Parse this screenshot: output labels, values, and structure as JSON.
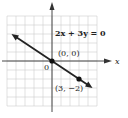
{
  "chart_data": {
    "type": "line",
    "title": "",
    "equation": "2x + 3y = 0",
    "xlabel": "x",
    "ylabel": "",
    "origin_label": "0",
    "xlim": [
      -5,
      5
    ],
    "ylim": [
      -5,
      5
    ],
    "grid": true,
    "series": [
      {
        "name": "2x + 3y = 0",
        "slope": -0.6667,
        "intercept": 0,
        "x": [
          -4.5,
          4.5
        ],
        "y": [
          3,
          -3
        ],
        "color": "#222222"
      }
    ],
    "points": [
      {
        "x": 0,
        "y": 0,
        "label": "(0, 0)"
      },
      {
        "x": 3,
        "y": -2,
        "label": "(3, −2)"
      }
    ]
  },
  "colors": {
    "grid": "#cfcfcf",
    "axis": "#333333",
    "line": "#222222"
  }
}
